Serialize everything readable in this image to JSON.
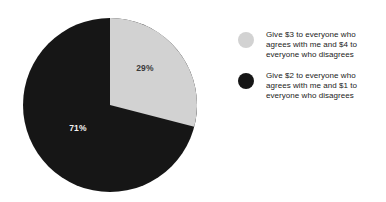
{
  "chart_data": {
    "type": "pie",
    "title": "",
    "subtitle": "",
    "xlabel": "",
    "ylabel": "",
    "grid": false,
    "legend_position": "right",
    "start_angle_deg": 0,
    "direction": "clockwise",
    "categories": [
      "Give $3 to everyone who agrees with me and $4 to everyone who disagrees",
      "Give $2 to everyone who agrees with me and $1 to everyone who disagrees"
    ],
    "values": [
      29,
      71
    ],
    "value_unit": "percent",
    "data_labels": [
      "29%",
      "71%"
    ],
    "colors": [
      "#d2d2d2",
      "#161616"
    ],
    "slices": [
      {
        "label": "Give $3 to everyone who agrees with me and $4 to everyone who disagrees",
        "value": 29,
        "data_label": "29%",
        "color": "#d2d2d2",
        "label_text_color": "#3a3a3a"
      },
      {
        "label": "Give $2 to everyone who agrees with me and $1 to everyone who disagrees",
        "value": 71,
        "data_label": "71%",
        "color": "#161616",
        "label_text_color": "#f2f2f2"
      }
    ]
  },
  "pie": {
    "label_light": "29%",
    "label_dark": "71%"
  },
  "legend": {
    "items": [
      {
        "swatch_color": "#d2d2d2",
        "line1": "Give $3 to everyone who",
        "line2": "agrees with me and $4 to",
        "line3": "everyone who disagrees",
        "text": "Give $3 to everyone who agrees with me and $4 to everyone who disagrees"
      },
      {
        "swatch_color": "#161616",
        "line1": "Give $2 to everyone who",
        "line2": "agrees with me and $1 to",
        "line3": "everyone who disagrees",
        "text": "Give $2 to everyone who agrees with me and $1 to everyone who disagrees"
      }
    ]
  },
  "colors": {
    "background": "#ffffff",
    "slice_light": "#d2d2d2",
    "slice_dark": "#161616",
    "legend_text": "#1b1b1b"
  }
}
